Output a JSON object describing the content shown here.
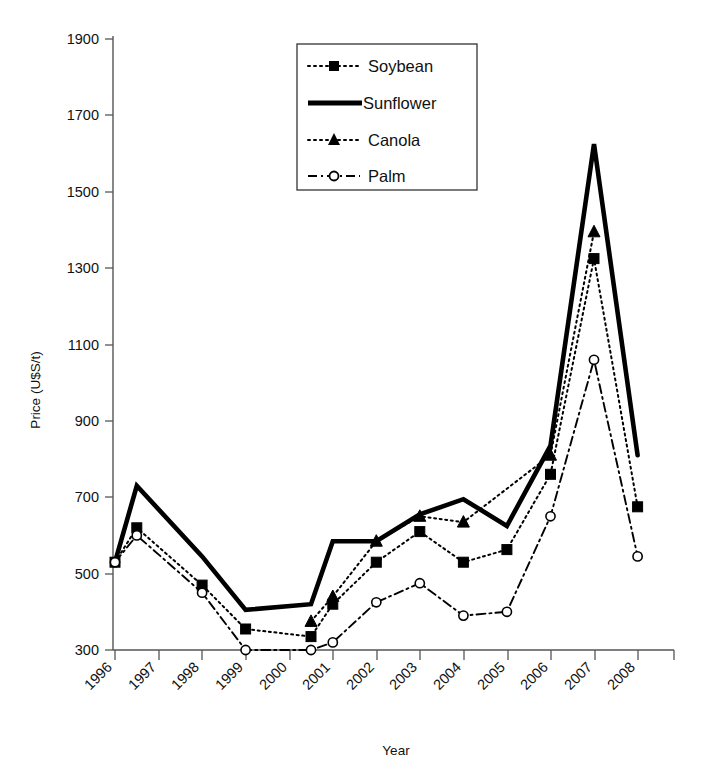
{
  "chart_data": {
    "type": "line",
    "title": "",
    "xlabel": "Year",
    "ylabel": "Price (U$S/t)",
    "grid": false,
    "legend_position": "top-center",
    "ylim": [
      300,
      1900
    ],
    "yticks": [
      300,
      500,
      700,
      900,
      1100,
      1300,
      1500,
      1700,
      1900
    ],
    "xticks": [
      "1996",
      "1997",
      "1998",
      "1999",
      "2000",
      "2001",
      "2002",
      "2003",
      "2004",
      "2005",
      "2006",
      "2007",
      "2008"
    ],
    "x": [
      1996,
      1996.5,
      1997,
      1998,
      1999,
      2000,
      2000.5,
      2001,
      2002,
      2003,
      2004,
      2005,
      2006,
      2007,
      2008
    ],
    "series": [
      {
        "name": "Soybean",
        "marker": "filled-square",
        "style": "dotted",
        "x": [
          1996,
          1996.5,
          1998,
          1999,
          2000.5,
          2001,
          2002,
          2003,
          2004,
          2005,
          2006,
          2007,
          2008
        ],
        "values": [
          530,
          620,
          470,
          355,
          335,
          420,
          530,
          610,
          530,
          563,
          760,
          1325,
          675
        ]
      },
      {
        "name": "Sunflower",
        "marker": "none",
        "style": "thick-solid",
        "x": [
          1996,
          1996.5,
          1998,
          1999,
          2000.5,
          2001,
          2002,
          2003,
          2004,
          2005,
          2006,
          2007,
          2008
        ],
        "values": [
          530,
          730,
          545,
          405,
          420,
          585,
          585,
          655,
          695,
          625,
          835,
          1625,
          810
        ]
      },
      {
        "name": "Canola",
        "marker": "filled-triangle",
        "style": "dotted",
        "x": [
          2000.5,
          2001,
          2002,
          2003,
          2004,
          2006,
          2007
        ],
        "values": [
          375,
          440,
          585,
          650,
          635,
          810,
          1395
        ]
      },
      {
        "name": "Palm",
        "marker": "open-circle",
        "style": "dash-dot",
        "x": [
          1996,
          1996.5,
          1998,
          1999,
          2000.5,
          2001,
          2002,
          2003,
          2004,
          2005,
          2006,
          2007,
          2008
        ],
        "values": [
          530,
          600,
          450,
          300,
          300,
          320,
          425,
          475,
          390,
          400,
          650,
          1060,
          545
        ]
      }
    ]
  },
  "legend": {
    "items": [
      {
        "label": "Soybean"
      },
      {
        "label": "Sunflower"
      },
      {
        "label": "Canola"
      },
      {
        "label": "Palm"
      }
    ]
  },
  "axes": {
    "y_label": "Price (U$S/t)",
    "x_label": "Year",
    "y_ticks": [
      "1900",
      "1700",
      "1500",
      "1300",
      "1100",
      "900",
      "700",
      "500",
      "300"
    ],
    "x_ticks": [
      "1996",
      "1997",
      "1998",
      "1999",
      "2000",
      "2001",
      "2002",
      "2003",
      "2004",
      "2005",
      "2006",
      "2007",
      "2008"
    ]
  },
  "colors": {
    "line": "#000000",
    "axis": "#555555",
    "background": "#ffffff"
  }
}
